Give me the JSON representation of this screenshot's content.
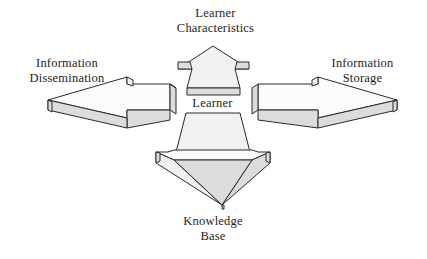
{
  "diagram": {
    "type": "block-arrow-cross",
    "style": {
      "arrow_face_color": "#f1f1f1",
      "arrow_side_color": "#dcdcdc",
      "arrow_top_color": "#fbfbfb",
      "outline_color": "#2b2b2b",
      "background_color": "#ffffff"
    },
    "labels": {
      "top": {
        "line1": "Learner",
        "line2": "Characteristics"
      },
      "left": {
        "line1": "Information",
        "line2": "Dissemination"
      },
      "right": {
        "line1": "Information",
        "line2": "Storage"
      },
      "center": {
        "line1": "Learner"
      },
      "bottom": {
        "line1": "Knowledge",
        "line2": "Base"
      }
    },
    "arrows": [
      {
        "name": "up-arrow",
        "direction": "up",
        "label": "Learner Characteristics"
      },
      {
        "name": "left-arrow",
        "direction": "left",
        "label": "Information Dissemination"
      },
      {
        "name": "right-arrow",
        "direction": "right",
        "label": "Information Storage"
      },
      {
        "name": "down-arrow",
        "direction": "down",
        "label": "Knowledge Base"
      }
    ]
  }
}
